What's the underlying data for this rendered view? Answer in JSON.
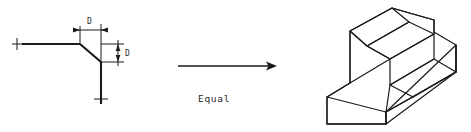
{
  "figure": {
    "background_color": "#ffffff",
    "line_color": "#1a1a1a",
    "width": 471,
    "height": 132
  },
  "left_view": {
    "name": "chamfer-2d-view",
    "description": "Orthographic corner view with 45 degree chamfer dimensioned D by D",
    "horizontal_dimension": {
      "label": "D",
      "label_x": 89,
      "label_y": 22,
      "dim_line_y": 30,
      "from_x": 80,
      "to_x": 101
    },
    "vertical_dimension": {
      "label": "D",
      "label_x": 128,
      "label_y": 63,
      "dim_line_x": 118,
      "from_y": 44,
      "to_y": 62
    },
    "geometry": {
      "top_horizontal_line": {
        "x1": 22,
        "y1": 44,
        "x2": 80,
        "y2": 44
      },
      "chamfer_line": {
        "x1": 80,
        "y1": 44,
        "x2": 101,
        "y2": 62
      },
      "bottom_vertical_line": {
        "x1": 101,
        "y1": 62,
        "x2": 101,
        "y2": 104
      },
      "extension_top": {
        "x": 80,
        "y1": 26,
        "y2": 44
      },
      "extension_right": {
        "x": 101,
        "y1": 26,
        "y2": 62
      },
      "extension_horizontal_upper": {
        "y": 44,
        "x1": 101,
        "x2": 124
      },
      "extension_horizontal_lower": {
        "y": 62,
        "x1": 101,
        "x2": 124
      }
    },
    "centerline_ticks": [
      {
        "name": "left-centerline-tick",
        "x": 17,
        "y": 44
      },
      {
        "name": "bottom-centerline-tick",
        "x": 101,
        "y": 99
      }
    ]
  },
  "equal_arrow": {
    "name": "equality-arrow",
    "label": "Equal",
    "label_x": 198,
    "label_y": 99,
    "shaft_from_x": 178,
    "shaft_to_x": 272,
    "shaft_y": 66
  },
  "right_view": {
    "name": "isometric-3d-view",
    "description": "Isometric pictorial of stepped block with chamfered top-front edge",
    "outline_points": "392,8 350,31 350,83 327,97 327,124 386,124 386,112 456,72 456,45 434,32 434,20",
    "faces": [
      {
        "name": "iso-top-face",
        "points": "392,8 350,31 367,46 409,22"
      },
      {
        "name": "iso-upper-chamfer-face",
        "points": "409,22 367,46 390,59 432,35"
      },
      {
        "name": "iso-upper-front-face",
        "points": "390,59 390,85 434,58 434,32"
      },
      {
        "name": "iso-left-face",
        "points": "350,31 350,83 390,59 367,46"
      },
      {
        "name": "iso-step-top-face",
        "points": "390,85 434,58 456,72 413,97"
      },
      {
        "name": "iso-lower-front-face",
        "points": "327,97 327,124 386,124 386,112"
      },
      {
        "name": "iso-right-face",
        "points": "413,97 456,72 456,45 434,58"
      }
    ]
  }
}
